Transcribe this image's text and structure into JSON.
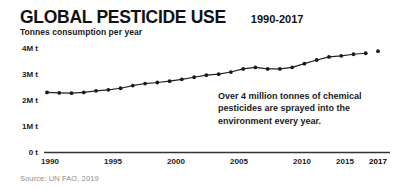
{
  "header": {
    "title": "GLOBAL PESTICIDE USE",
    "title_range": "1990-2017",
    "subtitle": "Tonnes consumption per year"
  },
  "annotation": {
    "text": "Over 4 million tonnes of chemical pesticides are sprayed into the environment every year."
  },
  "footer": {
    "source": "Source: UN FAO, 2019"
  },
  "colors": {
    "line": "#222222",
    "marker": "#1a1a1a",
    "axis": "#333333",
    "text": "#1a1a1a",
    "source_text": "#8d8d8d",
    "background": "#ffffff"
  },
  "chart_data": {
    "type": "line",
    "title": "GLOBAL PESTICIDE USE",
    "subtitle": "1990-2017",
    "xlabel": "",
    "ylabel": "Tonnes consumption per year",
    "ylim": [
      0,
      4000000
    ],
    "xlim": [
      1990,
      2017
    ],
    "grid": false,
    "legend": null,
    "ytick_labels": [
      "0 t",
      "1M t",
      "2M t",
      "3M t",
      "4M t"
    ],
    "ytick_values": [
      0,
      1000000,
      2000000,
      3000000,
      4000000
    ],
    "xtick_labels": [
      "1990",
      "1995",
      "2000",
      "2005",
      "2010",
      "2015",
      "2017"
    ],
    "xtick_values": [
      1990,
      1995,
      2000,
      2005,
      2010,
      2015,
      2017
    ],
    "x": [
      1990,
      1991,
      1992,
      1993,
      1994,
      1995,
      1996,
      1997,
      1998,
      1999,
      2000,
      2001,
      2002,
      2003,
      2004,
      2005,
      2006,
      2007,
      2008,
      2009,
      2010,
      2011,
      2012,
      2013,
      2014,
      2015,
      2016,
      2017
    ],
    "values": [
      2300000,
      2280000,
      2270000,
      2300000,
      2360000,
      2400000,
      2460000,
      2560000,
      2640000,
      2680000,
      2730000,
      2800000,
      2880000,
      2960000,
      3000000,
      3080000,
      3200000,
      3260000,
      3200000,
      3200000,
      3260000,
      3400000,
      3540000,
      3660000,
      3700000,
      3760000,
      3800000,
      3880000
    ],
    "series_name": "Pesticide use",
    "marker": "circle",
    "final_point_detached": true
  }
}
